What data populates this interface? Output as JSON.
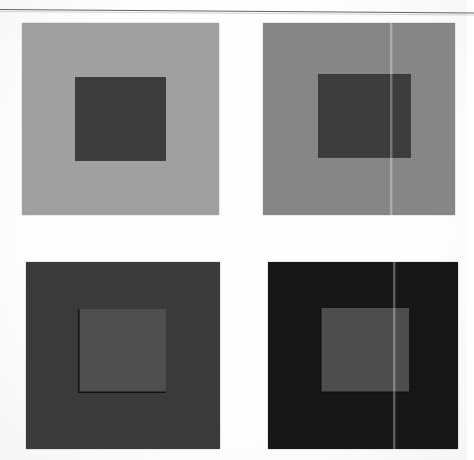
{
  "figure": {
    "layout": "2x2-grid",
    "panel_count": 4,
    "background_color": "#fefefe",
    "rule": {
      "name": "top-horizontal-rule",
      "color": "#4a4a4a",
      "thickness_px": 1.4,
      "rotation_deg": 0.42
    },
    "artifacts": {
      "vertical_seam_color": "#ffffff",
      "vertical_seam_note": "faint lighter vertical scan seam crossing the right-hand column"
    }
  },
  "panels": [
    {
      "id": "panel-top-left",
      "position": "top-left",
      "row": 1,
      "column": 1,
      "surround_color": "#a0a0a0",
      "surround_label": "light gray surround",
      "patch_color": "#3c3c3c",
      "patch_label": "dark test patch",
      "has_patch_contour": false,
      "has_seam": false,
      "geometry": {
        "x": 22,
        "y": 23,
        "width": 197,
        "height": 192
      },
      "patch_geometry": {
        "x": 75,
        "y": 77,
        "width": 91,
        "height": 84
      }
    },
    {
      "id": "panel-top-right",
      "position": "top-right",
      "row": 1,
      "column": 2,
      "surround_color": "#868686",
      "surround_label": "medium gray surround",
      "patch_color": "#3c3c3c",
      "patch_label": "dark test patch",
      "has_patch_contour": false,
      "has_seam": true,
      "geometry": {
        "x": 263,
        "y": 23,
        "width": 192,
        "height": 192
      },
      "patch_geometry": {
        "x": 318,
        "y": 74,
        "width": 93,
        "height": 84
      },
      "seam_x": 390
    },
    {
      "id": "panel-bottom-left",
      "position": "bottom-left",
      "row": 2,
      "column": 1,
      "surround_color": "#3a3a3a",
      "surround_label": "dark gray surround",
      "patch_color": "#4e4e4e",
      "patch_label": "light test patch",
      "has_patch_contour": true,
      "has_seam": false,
      "geometry": {
        "x": 26,
        "y": 262,
        "width": 194,
        "height": 187
      },
      "patch_geometry": {
        "x": 78,
        "y": 309,
        "width": 88,
        "height": 84
      }
    },
    {
      "id": "panel-bottom-right",
      "position": "bottom-right",
      "row": 2,
      "column": 2,
      "surround_color": "#161616",
      "surround_label": "near black surround",
      "patch_color": "#4d4d4d",
      "patch_label": "light test patch",
      "has_patch_contour": true,
      "has_seam": true,
      "geometry": {
        "x": 268,
        "y": 262,
        "width": 190,
        "height": 187
      },
      "patch_geometry": {
        "x": 320,
        "y": 308,
        "width": 89,
        "height": 85
      },
      "seam_x": 393
    }
  ]
}
